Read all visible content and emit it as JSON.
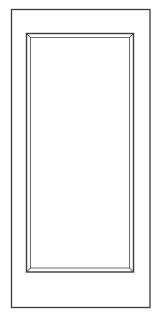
{
  "diagram": {
    "style": "line-drawing",
    "colors": {
      "background": "#ffffff",
      "stroke": "#3a3a3a",
      "inner_stroke": "#6a6a6a"
    },
    "parts": [
      {
        "name": "outer-frame",
        "label": ""
      },
      {
        "name": "inset-panel",
        "label": ""
      }
    ]
  }
}
